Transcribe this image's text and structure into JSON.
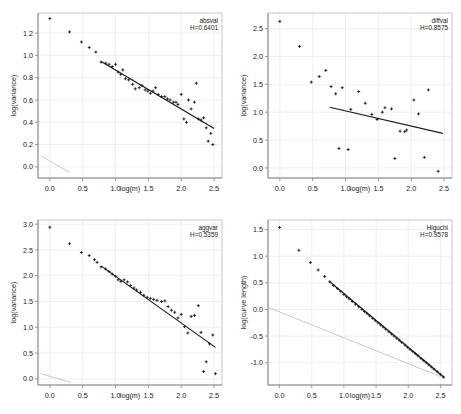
{
  "figure": {
    "title": "",
    "layout": "2x2 grid of log-log scatter plots with fitted regression lines",
    "panel_order": [
      "absval",
      "diffval",
      "aggvar",
      "higuchi"
    ]
  },
  "chart_data": [
    {
      "type": "scatter",
      "title": "absval",
      "annotation": "H=0.6401",
      "hurst_label": "H",
      "hurst_value": 0.6401,
      "xlabel": "log(m)",
      "ylabel": "log(variance)",
      "xlim": [
        -0.18,
        2.62
      ],
      "ylim": [
        -0.1,
        1.38
      ],
      "xticks": [
        0.0,
        0.5,
        1.0,
        1.5,
        2.0,
        2.5
      ],
      "xticklabels": [
        "0.0",
        "0.5",
        "1.0",
        "1.5",
        "2.0",
        "2.5"
      ],
      "yticks": [
        0.0,
        0.2,
        0.4,
        0.6,
        0.8,
        1.0,
        1.2
      ],
      "yticklabels": [
        "0.0",
        "0.2",
        "0.4",
        "0.6",
        "0.8",
        "1.0",
        "1.2"
      ],
      "grid": true,
      "legend": "none",
      "marker": "plus",
      "x": [
        0.0,
        0.3,
        0.48,
        0.6,
        0.7,
        0.78,
        0.85,
        0.9,
        0.95,
        1.0,
        1.04,
        1.08,
        1.11,
        1.15,
        1.2,
        1.26,
        1.3,
        1.36,
        1.4,
        1.45,
        1.49,
        1.53,
        1.57,
        1.61,
        1.65,
        1.7,
        1.75,
        1.79,
        1.83,
        1.88,
        1.92,
        1.95,
        2.0,
        2.04,
        2.08,
        2.11,
        2.15,
        2.2,
        2.23,
        2.26,
        2.3,
        2.34,
        2.38,
        2.41,
        2.45,
        2.48
      ],
      "y": [
        1.33,
        1.21,
        1.12,
        1.07,
        1.03,
        0.94,
        0.93,
        0.92,
        0.9,
        0.92,
        0.85,
        0.83,
        0.87,
        0.79,
        0.78,
        0.74,
        0.7,
        0.71,
        0.73,
        0.69,
        0.68,
        0.66,
        0.68,
        0.71,
        0.65,
        0.63,
        0.63,
        0.61,
        0.6,
        0.58,
        0.58,
        0.56,
        0.65,
        0.43,
        0.4,
        0.6,
        0.52,
        0.58,
        0.75,
        0.43,
        0.42,
        0.44,
        0.35,
        0.23,
        0.3,
        0.2
      ],
      "fit_line": {
        "x0": 0.78,
        "y0": 0.945,
        "x1": 2.5,
        "y1": 0.345,
        "color": "#1a1a1a"
      },
      "reference_line": {
        "x0": -0.14,
        "y0": 0.1,
        "x1": 0.3,
        "y1": -0.05,
        "color": "#c9c9c9"
      }
    },
    {
      "type": "scatter",
      "title": "diffval",
      "annotation": "H=0.8575",
      "hurst_label": "H",
      "hurst_value": 0.8575,
      "xlabel": "log(m)",
      "ylabel": "log(variance)",
      "xlim": [
        -0.18,
        2.62
      ],
      "ylim": [
        -0.18,
        2.78
      ],
      "xticks": [
        0.0,
        0.5,
        1.0,
        1.5,
        2.0,
        2.5
      ],
      "xticklabels": [
        "0.0",
        "0.5",
        "1.0",
        "1.5",
        "2.0",
        "2.5"
      ],
      "yticks": [
        0.0,
        0.5,
        1.0,
        1.5,
        2.0,
        2.5
      ],
      "yticklabels": [
        "0.0",
        "0.5",
        "1.0",
        "1.5",
        "2.0",
        "2.5"
      ],
      "grid": true,
      "legend": "none",
      "marker": "plus",
      "x": [
        0.0,
        0.3,
        0.48,
        0.6,
        0.7,
        0.78,
        0.85,
        0.9,
        0.95,
        1.04,
        1.08,
        1.2,
        1.3,
        1.4,
        1.48,
        1.56,
        1.6,
        1.7,
        1.75,
        1.83,
        1.9,
        1.93,
        2.04,
        2.11,
        2.2,
        2.26,
        2.41
      ],
      "y": [
        2.63,
        2.18,
        1.54,
        1.64,
        1.75,
        1.46,
        1.33,
        0.35,
        1.44,
        0.33,
        1.05,
        1.37,
        1.16,
        0.96,
        0.87,
        1.0,
        1.08,
        1.06,
        0.17,
        0.66,
        0.65,
        0.68,
        1.22,
        0.97,
        0.19,
        1.4,
        -0.06
      ],
      "fit_line": {
        "x0": 0.76,
        "y0": 1.09,
        "x1": 2.48,
        "y1": 0.62,
        "color": "#1a1a1a"
      },
      "reference_line": null
    },
    {
      "type": "scatter",
      "title": "aggvar",
      "annotation": "H=0.5359",
      "hurst_label": "H",
      "hurst_value": 0.5359,
      "xlabel": "log(m)",
      "ylabel": "log(variance)",
      "xlim": [
        -0.18,
        2.62
      ],
      "ylim": [
        -0.12,
        3.08
      ],
      "xticks": [
        0.0,
        0.5,
        1.0,
        1.5,
        2.0,
        2.5
      ],
      "xticklabels": [
        "0.0",
        "0.5",
        "1.0",
        "1.5",
        "2.0",
        "2.5"
      ],
      "yticks": [
        0.0,
        0.5,
        1.0,
        1.5,
        2.0,
        2.5,
        3.0
      ],
      "yticklabels": [
        "0.0",
        "0.5",
        "1.0",
        "1.5",
        "2.0",
        "2.5",
        "3.0"
      ],
      "grid": true,
      "legend": "none",
      "marker": "plus",
      "x": [
        0.0,
        0.3,
        0.48,
        0.6,
        0.68,
        0.72,
        0.78,
        0.85,
        0.9,
        0.95,
        1.0,
        1.04,
        1.08,
        1.13,
        1.18,
        1.23,
        1.28,
        1.32,
        1.38,
        1.43,
        1.48,
        1.53,
        1.58,
        1.63,
        1.7,
        1.75,
        1.8,
        1.85,
        1.9,
        1.95,
        2.0,
        2.05,
        2.1,
        2.15,
        2.2,
        2.26,
        2.3,
        2.34,
        2.38,
        2.43,
        2.48,
        2.52
      ],
      "y": [
        2.94,
        2.62,
        2.45,
        2.39,
        2.31,
        2.26,
        2.17,
        2.13,
        2.08,
        2.03,
        1.99,
        1.92,
        1.89,
        1.92,
        1.88,
        1.81,
        1.76,
        1.72,
        1.68,
        1.62,
        1.58,
        1.56,
        1.54,
        1.52,
        1.5,
        1.51,
        1.4,
        1.33,
        1.29,
        1.18,
        1.25,
        1.01,
        0.89,
        1.21,
        1.23,
        1.42,
        0.9,
        0.14,
        0.33,
        0.68,
        0.85,
        0.1
      ],
      "fit_line": {
        "x0": 0.79,
        "y0": 2.18,
        "x1": 2.52,
        "y1": 0.61,
        "color": "#1a1a1a"
      },
      "reference_line": {
        "x0": -0.14,
        "y0": 0.1,
        "x1": 0.32,
        "y1": -0.07,
        "color": "#c9c9c9"
      }
    },
    {
      "type": "scatter",
      "title": "Higuchi",
      "annotation": "H=0.9578",
      "hurst_label": "H",
      "hurst_value": 0.9578,
      "xlabel": "log(m)",
      "ylabel": "log(curve length)",
      "xlim": [
        -0.18,
        2.68
      ],
      "ylim": [
        -1.42,
        1.68
      ],
      "xticks": [
        0.0,
        0.5,
        1.0,
        1.5,
        2.0,
        2.5
      ],
      "xticklabels": [
        "0.0",
        "0.5",
        "1.0",
        "1.5",
        "2.0",
        "2.5"
      ],
      "yticks": [
        -1.0,
        -0.5,
        0.0,
        0.5,
        1.0,
        1.5
      ],
      "yticklabels": [
        "-1.0",
        "-0.5",
        "0.0",
        "0.5",
        "1.0",
        "1.5"
      ],
      "grid": true,
      "legend": "none",
      "marker": "plus",
      "x": [
        0.0,
        0.3,
        0.48,
        0.6,
        0.7,
        0.78,
        0.84,
        0.9,
        0.95,
        1.0,
        1.04,
        1.08,
        1.13,
        1.18,
        1.23,
        1.28,
        1.32,
        1.36,
        1.4,
        1.45,
        1.49,
        1.53,
        1.57,
        1.61,
        1.65,
        1.7,
        1.74,
        1.78,
        1.82,
        1.86,
        1.9,
        1.95,
        1.99,
        2.03,
        2.07,
        2.11,
        2.15,
        2.2,
        2.24,
        2.28,
        2.32,
        2.36,
        2.4,
        2.45,
        2.5,
        2.55
      ],
      "y": [
        1.54,
        1.11,
        0.88,
        0.74,
        0.62,
        0.52,
        0.45,
        0.39,
        0.34,
        0.28,
        0.24,
        0.2,
        0.15,
        0.1,
        0.05,
        0.0,
        -0.04,
        -0.08,
        -0.12,
        -0.17,
        -0.21,
        -0.25,
        -0.29,
        -0.33,
        -0.37,
        -0.42,
        -0.46,
        -0.5,
        -0.54,
        -0.58,
        -0.62,
        -0.67,
        -0.71,
        -0.75,
        -0.79,
        -0.83,
        -0.87,
        -0.92,
        -0.96,
        -1.0,
        -1.04,
        -1.08,
        -1.12,
        -1.17,
        -1.22,
        -1.27
      ],
      "fit_line": {
        "x0": 0.78,
        "y0": 0.52,
        "x1": 2.55,
        "y1": -1.27,
        "color": "#1a1a1a"
      },
      "reference_line": {
        "x0": -0.16,
        "y0": 0.03,
        "x1": 2.58,
        "y1": -1.3,
        "color": "#c9c9c9"
      }
    }
  ]
}
